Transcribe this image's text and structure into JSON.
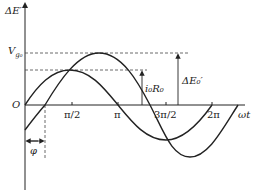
{
  "diagram": {
    "y_axis_label": "ΔE′",
    "x_axis_label": "ωt",
    "origin_label": "O",
    "level_labels": {
      "vg0": "V",
      "vg0_sub": "g₀"
    },
    "x_ticks": [
      "π/2",
      "π",
      "3π/2",
      "2π"
    ],
    "annotations": {
      "i0R0": "i₀R₀",
      "delta_E0": "ΔE₀′",
      "phi": "φ"
    },
    "curves": [
      {
        "name": "small-amplitude sine",
        "amplitude_label": "i₀R₀",
        "phase": 0
      },
      {
        "name": "large-amplitude sine",
        "amplitude_label": "ΔE₀′",
        "phase_label": "φ"
      }
    ],
    "colors": {
      "line": "#222222",
      "dash": "#444444"
    }
  }
}
